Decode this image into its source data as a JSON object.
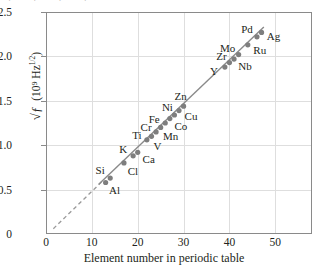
{
  "figure": {
    "top_cut_text": "·   ·            ·        ·",
    "background": "#ffffff",
    "marker_color": "#7e7e7e",
    "line_color": "#8a8a8a",
    "grid_color": "#dedede",
    "axis_color": "#8a8a8a"
  },
  "chart_data": {
    "type": "scatter",
    "title": "",
    "xlabel": "Element number in periodic table",
    "ylabel_parts": {
      "radical": "√ƒ",
      "units": "(10⁹ Hz",
      "exponent": "1/2",
      "close": ")"
    },
    "ylabel_plain": "√ƒ  (10⁹ Hz1/2)",
    "xlim": [
      0,
      58
    ],
    "ylim": [
      0,
      2.5
    ],
    "xticks": [
      0,
      10,
      20,
      30,
      40,
      50
    ],
    "yticks": [
      "0",
      "0.5",
      "1.0",
      "1.5",
      "2.0",
      "2.5"
    ],
    "ytick_values": [
      0,
      0.5,
      1.0,
      1.5,
      2.0,
      2.5
    ],
    "grid": true,
    "legend": "none",
    "fit_line": {
      "x_start": 11.5,
      "y_start": 0.56,
      "x_end": 47.5,
      "y_end": 2.33
    },
    "extrapolation": {
      "style": "dashed",
      "x_start": 1.6,
      "y_start": 0.06,
      "x_end": 12.4,
      "y_end": 0.6
    },
    "points": [
      {
        "label": "Si",
        "x": 14,
        "y": 0.63,
        "label_dx": -10,
        "label_dy": -8
      },
      {
        "label": "Al",
        "x": 13,
        "y": 0.58,
        "label_dx": 9,
        "label_dy": 8
      },
      {
        "label": "Cl",
        "x": 17,
        "y": 0.8,
        "label_dx": 9,
        "label_dy": 8
      },
      {
        "label": "K",
        "x": 19,
        "y": 0.88,
        "label_dx": -10,
        "label_dy": -7
      },
      {
        "label": "Ca",
        "x": 20,
        "y": 0.92,
        "label_dx": 11,
        "label_dy": 7
      },
      {
        "label": "Ti",
        "x": 22,
        "y": 1.06,
        "label_dx": -10,
        "label_dy": -5
      },
      {
        "label": "V",
        "x": 23,
        "y": 1.1,
        "label_dx": 6,
        "label_dy": 10
      },
      {
        "label": "Cr",
        "x": 24,
        "y": 1.15,
        "label_dx": -10,
        "label_dy": -5
      },
      {
        "label": "Mn",
        "x": 25,
        "y": 1.2,
        "label_dx": 10,
        "label_dy": 9
      },
      {
        "label": "Fe",
        "x": 26,
        "y": 1.25,
        "label_dx": -11,
        "label_dy": -4
      },
      {
        "label": "Co",
        "x": 27,
        "y": 1.3,
        "label_dx": 11,
        "label_dy": 7
      },
      {
        "label": "Ni",
        "x": 28,
        "y": 1.34,
        "label_dx": -7,
        "label_dy": -8
      },
      {
        "label": "Cu",
        "x": 29,
        "y": 1.39,
        "label_dx": 12,
        "label_dy": 5
      },
      {
        "label": "Zn",
        "x": 30,
        "y": 1.44,
        "label_dx": -3,
        "label_dy": -10
      },
      {
        "label": "Y",
        "x": 39,
        "y": 1.88,
        "label_dx": -11,
        "label_dy": 4
      },
      {
        "label": "Zr",
        "x": 40,
        "y": 1.93,
        "label_dx": -8,
        "label_dy": -7
      },
      {
        "label": "Nb",
        "x": 41,
        "y": 1.97,
        "label_dx": 11,
        "label_dy": 7
      },
      {
        "label": "Mo",
        "x": 42,
        "y": 2.02,
        "label_dx": -11,
        "label_dy": -7
      },
      {
        "label": "Ru",
        "x": 44,
        "y": 2.13,
        "label_dx": 12,
        "label_dy": 5
      },
      {
        "label": "Pd",
        "x": 46,
        "y": 2.22,
        "label_dx": -10,
        "label_dy": -8
      },
      {
        "label": "Ag",
        "x": 47,
        "y": 2.27,
        "label_dx": 12,
        "label_dy": 4
      }
    ]
  }
}
